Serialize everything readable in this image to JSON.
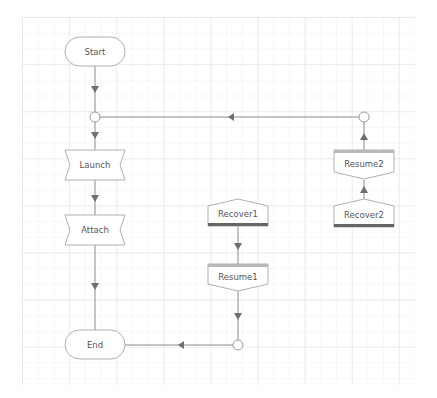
{
  "diagram": {
    "type": "flowchart",
    "colors": {
      "grid_minor": "#efefef",
      "grid_major": "#e2e2e2",
      "stroke": "#8a8a8a",
      "arrow": "#6f6f6f",
      "shape_fill": "#ffffff",
      "shape_border": "#b0b0b0",
      "bar_dark": "#666666",
      "bar_light": "#b8b8b8"
    },
    "nodes": [
      {
        "id": "start",
        "label": "Start",
        "shape": "terminator"
      },
      {
        "id": "launch",
        "label": "Launch",
        "shape": "bowtie"
      },
      {
        "id": "attach",
        "label": "Attach",
        "shape": "bowtie"
      },
      {
        "id": "end",
        "label": "End",
        "shape": "terminator"
      },
      {
        "id": "recover1",
        "label": "Recover1",
        "shape": "pentagon-up-bar-bottom"
      },
      {
        "id": "resume1",
        "label": "Resume1",
        "shape": "pentagon-down-bar-top"
      },
      {
        "id": "resume2",
        "label": "Resume2",
        "shape": "pentagon-down-bar-top"
      },
      {
        "id": "recover2",
        "label": "Recover2",
        "shape": "pentagon-up-bar-bottom"
      }
    ],
    "edges": [
      {
        "from": "start",
        "to": "junction-top"
      },
      {
        "from": "junction-top",
        "to": "launch"
      },
      {
        "from": "launch",
        "to": "attach"
      },
      {
        "from": "attach",
        "to": "end"
      },
      {
        "from": "recover1",
        "to": "resume1"
      },
      {
        "from": "resume1",
        "to": "junction-bottom"
      },
      {
        "from": "junction-bottom",
        "to": "end"
      },
      {
        "from": "recover2",
        "to": "resume2"
      },
      {
        "from": "resume2",
        "to": "junction-right"
      },
      {
        "from": "junction-right",
        "to": "junction-top"
      }
    ]
  }
}
